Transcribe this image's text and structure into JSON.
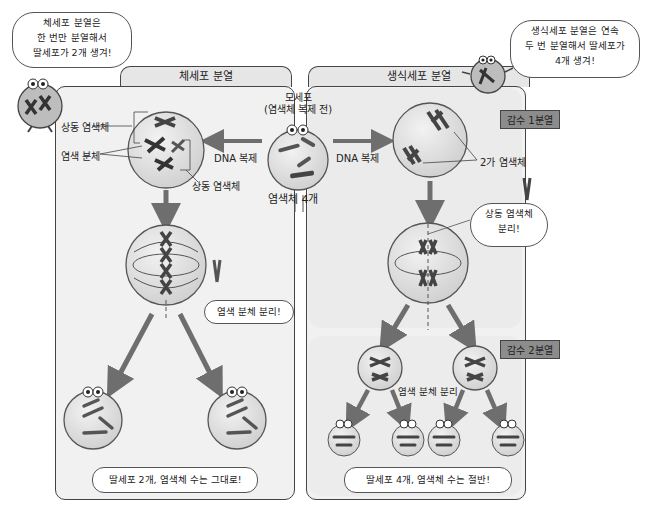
{
  "mitosis": {
    "title": "체세포 분열",
    "mascot_bubble": [
      "체세포 분열은",
      "한 번만 분열해서",
      "딸세포가 2개 생겨!"
    ],
    "labels": {
      "homologous_top": "상동 염색체",
      "sister_chromatid": "염색 분체",
      "homologous_bottom": "상동 염색체",
      "dna_replication": "DNA 복제"
    },
    "separation_bubble": "염색 분체 분리!",
    "result_bubble": "딸세포 2개, 염색체 수는 그대로!"
  },
  "mother_cell": {
    "title_line1": "모세포",
    "title_line2": "(염색체 복제 전)",
    "chromosome_count": "염색체 4개"
  },
  "meiosis": {
    "title": "생식세포 분열",
    "mascot_bubble": [
      "생식세포 분열은 연속",
      "두 번 분열해서 딸세포가",
      "4개 생겨!"
    ],
    "dna_replication": "DNA 복제",
    "bivalent_label": "2가 염색체",
    "stage1": "감수 1분열",
    "homologous_bubble": [
      "상동 염색체",
      "분리!"
    ],
    "stage2": "감수 2분열",
    "chromatid_separation": "염색 분체 분리",
    "result_bubble": "딸세포 4개, 염색체 수는 절반!"
  },
  "colors": {
    "panel_bg": "#f1f1f1",
    "cell_fill": "#e4e4e4",
    "chromosome": "#555555",
    "arrow": "#6e6e6e",
    "stage_badge": "#8c8c8c"
  }
}
